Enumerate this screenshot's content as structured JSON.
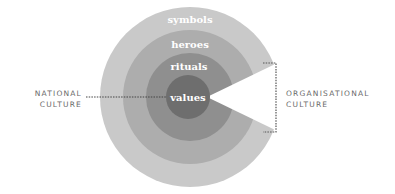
{
  "diagram": {
    "layers": [
      {
        "label": "symbols",
        "radius": 90,
        "color": "#c9c9c9"
      },
      {
        "label": "heroes",
        "radius": 67,
        "color": "#adadad"
      },
      {
        "label": "rituals",
        "radius": 44,
        "color": "#8f8f8f"
      },
      {
        "label": "values",
        "radius": 22,
        "color": "#6e6e6e"
      }
    ],
    "left_label": {
      "line1": "NATIONAL",
      "line2": "CULTURE"
    },
    "right_label": {
      "line1": "ORGANISATIONAL",
      "line2": "CULTURE"
    },
    "colors": {
      "background": "#ffffff",
      "text_labels": "#6a6a6a",
      "ring_text": "#ffffff",
      "dotted_line": "#555555"
    }
  }
}
